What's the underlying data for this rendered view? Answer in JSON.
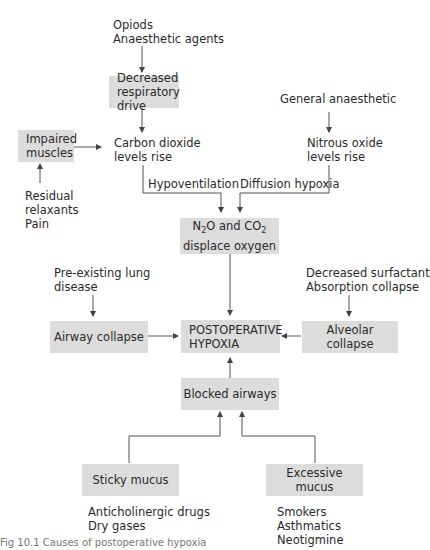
{
  "diagram": {
    "nodes": {
      "opioids": {
        "line1": "Opiods",
        "line2": "Anaesthetic agents"
      },
      "decreased_resp_drive": {
        "line1": "Decreased",
        "line2": "respiratory drive"
      },
      "general_anaesthetic": {
        "label": "General anaesthetic"
      },
      "impaired_muscles": {
        "line1": "Impaired",
        "line2": "muscles"
      },
      "co2_rise": {
        "line1": "Carbon dioxide",
        "line2": "levels rise"
      },
      "n2o_rise": {
        "line1": "Nitrous oxide",
        "line2": "levels rise"
      },
      "residual": {
        "line1": "Residual",
        "line2": "relaxants",
        "line3": "Pain"
      },
      "hypoventilation": {
        "label": "Hypoventilation"
      },
      "diffusion_hypoxia": {
        "label": "Diffusion hypoxia"
      },
      "displace_oxygen": {
        "line1_pre": "N",
        "line1_sub1": "2",
        "line1_mid": "O and CO",
        "line1_sub2": "2",
        "line2": "displace oxygen"
      },
      "pre_existing": {
        "line1": "Pre-existing lung",
        "line2": "disease"
      },
      "decreased_surfactant": {
        "line1": "Decreased surfactant",
        "line2": "Absorption collapse"
      },
      "airway_collapse": {
        "label": "Airway collapse"
      },
      "postop_hypoxia": {
        "line1": "POSTOPERATIVE",
        "line2": "HYPOXIA"
      },
      "alveolar_collapse": {
        "label": "Alveolar collapse"
      },
      "blocked_airways": {
        "label": "Blocked airways"
      },
      "sticky_mucus": {
        "label": "Sticky mucus"
      },
      "excessive_mucus": {
        "label": "Excessive mucus"
      },
      "sticky_causes": {
        "line1": "Anticholinergic drugs",
        "line2": "Dry gases"
      },
      "excessive_causes": {
        "line1": "Smokers",
        "line2": "Asthmatics",
        "line3": "Neotigmine"
      }
    },
    "caption": "Fig 10.1 Causes of postoperative hypoxia"
  },
  "colors": {
    "box_fill": "#dcdcdc",
    "line": "#444444",
    "text": "#2a2a2a"
  }
}
